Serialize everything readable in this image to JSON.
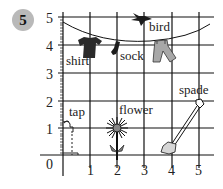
{
  "question_number": "5",
  "grid": {
    "x_ticks": [
      "0",
      "1",
      "2",
      "3",
      "4",
      "5"
    ],
    "y_ticks": [
      "1",
      "2",
      "3",
      "4",
      "5"
    ],
    "origin_label": "0"
  },
  "items": [
    {
      "name": "shirt",
      "label": "shirt",
      "x": 1,
      "y": 4
    },
    {
      "name": "sock",
      "label": "sock",
      "x": 2,
      "y": 4
    },
    {
      "name": "bird",
      "label": "bird",
      "x": 3,
      "y": 5
    },
    {
      "name": "trousers",
      "label": "",
      "x": 4,
      "y": 4
    },
    {
      "name": "tap",
      "label": "tap",
      "x": 0,
      "y": 1
    },
    {
      "name": "flower",
      "label": "flower",
      "x": 2,
      "y": 1
    },
    {
      "name": "spade",
      "label": "spade",
      "x": 5,
      "y": 2
    }
  ],
  "labels": {
    "shirt": "shirt",
    "sock": "sock",
    "bird": "bird",
    "tap": "tap",
    "flower": "flower",
    "spade": "spade"
  },
  "colors": {
    "grid": "#111111",
    "badge": "#b9b9b9",
    "clothing_dark": "#2a2a2a",
    "clothing_light": "#a8a8a8",
    "flower_center": "#888888"
  }
}
